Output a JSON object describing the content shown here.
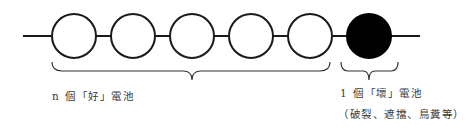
{
  "diagram": {
    "good_cells": {
      "count": 5,
      "fill": "#ffffff",
      "stroke": "#1a1a1a"
    },
    "bad_cell": {
      "fill": "#000000"
    },
    "labels": {
      "good": "n 個「好」電池",
      "bad": "1 個「壞」電池",
      "bad_causes": "（破裂、遮擋、鳥糞等）"
    }
  }
}
